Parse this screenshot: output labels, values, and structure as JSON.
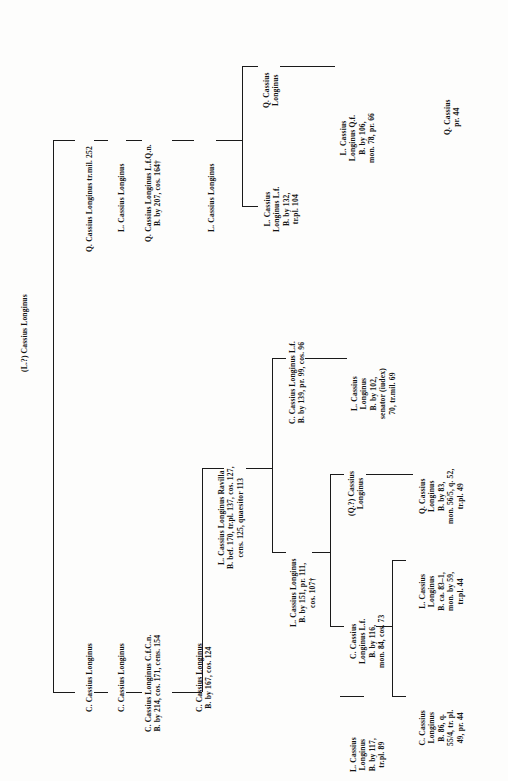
{
  "figure": {
    "type": "genealogical-stemma",
    "orientation": "rotated-90-ccw",
    "family": "Cassii Longini",
    "root_label": "(L.?) Cassius Longinus"
  },
  "nodes": {
    "root": {
      "lines": [
        "(L.?) Cassius Longinus"
      ]
    },
    "q_trmil252": {
      "lines": [
        "Q. Cassius Longinus tr.mil. 252"
      ]
    },
    "l_plain_a": {
      "lines": [
        "L. Cassius Longinus"
      ]
    },
    "q_cos164": {
      "lines": [
        "Q. Cassius Longinus L.f.Q.n.",
        "B. by 207, cos. 164†"
      ]
    },
    "l_plain_b": {
      "lines": [
        "L. Cassius Longinus"
      ]
    },
    "q_cassius_longinus_short": {
      "lines": [
        "Q. Cassius",
        "Longinus"
      ]
    },
    "l_lf_trpl104": {
      "lines": [
        "L. Cassius",
        "Longinus L.f.",
        "B. by 132,",
        "tr.pl. 104"
      ]
    },
    "l_qf_pr66": {
      "lines": [
        "L. Cassius",
        "Longinus Q.f.",
        "B. by 106,",
        "mon. 78, pr. 66"
      ]
    },
    "q_cassius_pr44": {
      "lines": [
        "Q. Cassius",
        "pr. 44"
      ]
    },
    "c_plain_a": {
      "lines": [
        "C. Cassius Longinus"
      ]
    },
    "c_plain_b": {
      "lines": [
        "C. Cassius Longinus"
      ]
    },
    "c_cens154": {
      "lines": [
        "C. Cassius Longinus C.f.C.n.",
        "B. by 214, cos. 171, cens. 154"
      ]
    },
    "c_cos124": {
      "lines": [
        "C. Cassius Longinus",
        "B. by 167, cos. 124"
      ]
    },
    "ravilla": {
      "lines": [
        "L. Cassius Longinus Ravilla",
        "B. bef. 170, tr.pl. 137, cos. 127,",
        "cens. 125, quaesitor 113"
      ]
    },
    "c_lf_cos96": {
      "lines": [
        "C. Cassius Longinus L.f.",
        "B. by 139, pr. 99, cos. 96"
      ]
    },
    "l_cos107": {
      "lines": [
        "L. Cassius Longinus",
        "B. by 151, pr. 111,",
        "cos. 107†"
      ]
    },
    "l_iudex70": {
      "lines": [
        "L. Cassius",
        "Longinus",
        "B. by 102,",
        "senator (iudex)",
        "70, tr.mil. 69"
      ]
    },
    "q_question": {
      "lines": [
        "(Q.?) Cassius",
        "Longinus"
      ]
    },
    "c_lf_cos73": {
      "lines": [
        "C. Cassius",
        "Longinus L.f.",
        "B. by 116,",
        "mon. 84, cos. 73"
      ]
    },
    "l_trpl89": {
      "lines": [
        "L. Cassius",
        "Longinus",
        "B. by 117,",
        "tr.pl. 89"
      ]
    },
    "q_trpl49": {
      "lines": [
        "Q. Cassius",
        "Longinus",
        "B. by 83,",
        "mon. 56/5, q. 52,",
        "tr.pl. 49"
      ]
    },
    "l_trpl44": {
      "lines": [
        "L. Cassius",
        "Longinus",
        "B. ca. 83–1,",
        "mon. by 59,",
        "tr.pl. 44"
      ]
    },
    "c_pr44": {
      "lines": [
        "C. Cassius",
        "Longinus",
        "B. 86, q.",
        "55/4, tr. pl.",
        "49, pr. 44"
      ]
    }
  },
  "colors": {
    "ink": "#121212",
    "paper": "#fdfdfc",
    "rule": "#1a1a1a"
  }
}
